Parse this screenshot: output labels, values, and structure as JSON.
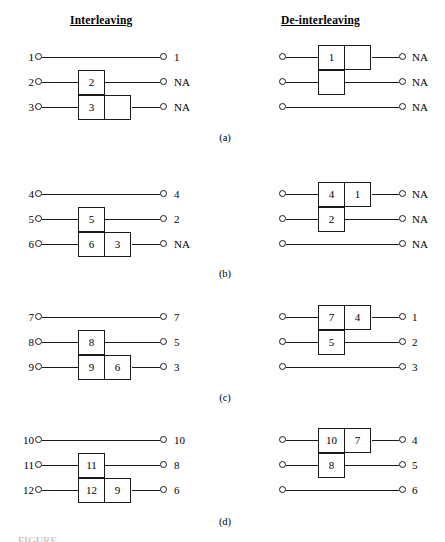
{
  "headers": {
    "left": "Interleaving",
    "right": "De-interleaving"
  },
  "panels": [
    {
      "label": "(a)",
      "left_rows": [
        {
          "in": "1",
          "cells": [],
          "out": "1"
        },
        {
          "in": "2",
          "cells": [
            "2"
          ],
          "out": "NA"
        },
        {
          "in": "3",
          "cells": [
            "3",
            ""
          ],
          "out": "NA"
        }
      ],
      "right_rows": [
        {
          "in": "",
          "cells": [
            "1",
            ""
          ],
          "out": "NA"
        },
        {
          "in": "",
          "cells": [
            ""
          ],
          "out": "NA"
        },
        {
          "in": "",
          "cells": [],
          "out": "NA"
        }
      ]
    },
    {
      "label": "(b)",
      "left_rows": [
        {
          "in": "4",
          "cells": [],
          "out": "4"
        },
        {
          "in": "5",
          "cells": [
            "5"
          ],
          "out": "2"
        },
        {
          "in": "6",
          "cells": [
            "6",
            "3"
          ],
          "out": "NA"
        }
      ],
      "right_rows": [
        {
          "in": "",
          "cells": [
            "4",
            "1"
          ],
          "out": "NA"
        },
        {
          "in": "",
          "cells": [
            "2"
          ],
          "out": "NA"
        },
        {
          "in": "",
          "cells": [],
          "out": "NA"
        }
      ]
    },
    {
      "label": "(c)",
      "left_rows": [
        {
          "in": "7",
          "cells": [],
          "out": "7"
        },
        {
          "in": "8",
          "cells": [
            "8"
          ],
          "out": "5"
        },
        {
          "in": "9",
          "cells": [
            "9",
            "6"
          ],
          "out": "3"
        }
      ],
      "right_rows": [
        {
          "in": "",
          "cells": [
            "7",
            "4"
          ],
          "out": "1"
        },
        {
          "in": "",
          "cells": [
            "5"
          ],
          "out": "2"
        },
        {
          "in": "",
          "cells": [],
          "out": "3"
        }
      ]
    },
    {
      "label": "(d)",
      "left_rows": [
        {
          "in": "10",
          "cells": [],
          "out": "10"
        },
        {
          "in": "11",
          "cells": [
            "11"
          ],
          "out": "8"
        },
        {
          "in": "12",
          "cells": [
            "12",
            "9"
          ],
          "out": "6"
        }
      ],
      "right_rows": [
        {
          "in": "",
          "cells": [
            "10",
            "7"
          ],
          "out": "4"
        },
        {
          "in": "",
          "cells": [
            "8"
          ],
          "out": "5"
        },
        {
          "in": "",
          "cells": [],
          "out": "6"
        }
      ]
    }
  ],
  "geometry": {
    "panel_tops": [
      45,
      182,
      305,
      428
    ],
    "row_gap": 25,
    "left": {
      "label_x": 12,
      "start_x": 35,
      "end_x": 160,
      "box_x": 78
    },
    "right": {
      "start_x": 279,
      "end_x": 399,
      "box_x": 318,
      "label_x": 412
    },
    "panel_label_tops": [
      132,
      268,
      392,
      516
    ]
  },
  "colors": {
    "ink": "#1a1a1a",
    "background": "#ffffff"
  }
}
